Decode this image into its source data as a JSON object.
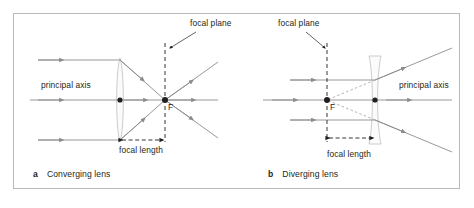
{
  "figure": {
    "background_color": "#ffffff",
    "frame_color": "#b9b9b9",
    "ray_color": "#8c8c8c",
    "axis_color": "#8c8c8c",
    "lens_color": "#c8c8c8",
    "dashed_color": "#231f20",
    "text_color": "#231f20",
    "virtual_ray_color": "#b0a0a0"
  },
  "panels": [
    {
      "id": "a",
      "letter": "a",
      "caption": "Converging lens",
      "labels": {
        "principal_axis": "principal axis",
        "focal_plane": "focal plane",
        "focal_length": "focal length",
        "focal_point": "F"
      }
    },
    {
      "id": "b",
      "letter": "b",
      "caption": "Diverging lens",
      "labels": {
        "principal_axis": "principal axis",
        "focal_plane": "focal plane",
        "focal_length": "focal length",
        "focal_point": "F"
      }
    }
  ],
  "geometry": {
    "panel_a": {
      "lens_center_x": 120,
      "axis_y": 100,
      "focal_point_x": 165,
      "focal_plane_x": 165,
      "focal_length_value": 45
    },
    "panel_b": {
      "lens_center_x": 375,
      "axis_y": 100,
      "focal_point_x": 327,
      "focal_plane_x": 327,
      "focal_length_value": 48
    }
  }
}
